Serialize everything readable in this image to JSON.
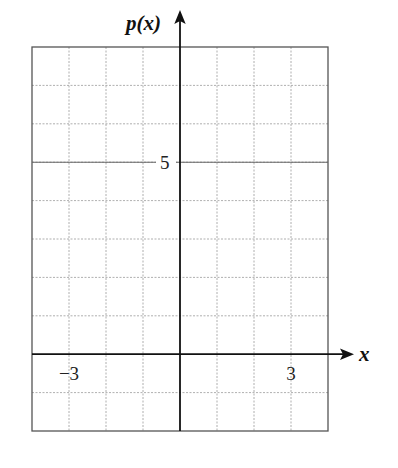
{
  "chart_data": {
    "type": "line",
    "title": "",
    "xlabel": "x",
    "ylabel": "p(x)",
    "xlim": [
      -4,
      4
    ],
    "ylim": [
      -2,
      8
    ],
    "grid": true,
    "grid_step_x": 1,
    "grid_step_y": 1,
    "x_tick_labels": [
      {
        "value": -3,
        "label": "−3"
      },
      {
        "value": 3,
        "label": "3"
      }
    ],
    "y_tick_labels": [
      {
        "value": 5,
        "label": "5"
      }
    ],
    "series": []
  },
  "labels": {
    "x_axis": "x",
    "y_axis": "p(x)",
    "x_tick_neg3": "−3",
    "x_tick_3": "3",
    "y_tick_5": "5"
  },
  "colors": {
    "grid": "#9a9a9a",
    "border": "#555555",
    "axis": "#111111"
  }
}
